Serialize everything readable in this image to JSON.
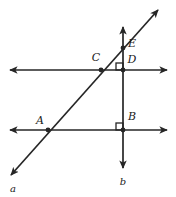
{
  "figure": {
    "width": 176,
    "height": 197,
    "background_color": "#ffffff",
    "stroke_color": "#262626",
    "label_color": "#1a1a1a"
  },
  "labels": {
    "point_A": "A",
    "point_B": "B",
    "point_C": "C",
    "point_D": "D",
    "point_E": "E",
    "line_a": "a",
    "line_b": "b"
  },
  "geometry": {
    "horizontal_line_upper": {
      "x1": 10,
      "y1": 70,
      "x2": 167,
      "y2": 70
    },
    "horizontal_line_lower": {
      "x1": 10,
      "y1": 130,
      "x2": 167,
      "y2": 130
    },
    "vertical_line_b": {
      "x1": 123,
      "y1": 27,
      "x2": 123,
      "y2": 168
    },
    "transversal_line_a": {
      "x1": 11,
      "y1": 175,
      "x2": 158,
      "y2": 10
    },
    "points": [
      {
        "name": "A",
        "x": 48,
        "y": 130,
        "label_x": 40,
        "label_y": 121
      },
      {
        "name": "B",
        "x": 123,
        "y": 130,
        "label_x": 132,
        "label_y": 117
      },
      {
        "name": "C",
        "x": 101,
        "y": 70,
        "label_x": 96,
        "label_y": 58
      },
      {
        "name": "D",
        "x": 123,
        "y": 70,
        "label_x": 132,
        "label_y": 60
      },
      {
        "name": "E",
        "x": 123,
        "y": 48,
        "label_x": 132,
        "label_y": 44
      }
    ],
    "right_angle_marks": [
      {
        "at_point": "D",
        "x": 115,
        "y": 62,
        "size": 7
      },
      {
        "at_point": "B",
        "x": 115,
        "y": 122,
        "size": 7
      }
    ],
    "line_label_positions": {
      "a": {
        "x": 13,
        "y": 189
      },
      "b": {
        "x": 123,
        "y": 182
      }
    }
  }
}
